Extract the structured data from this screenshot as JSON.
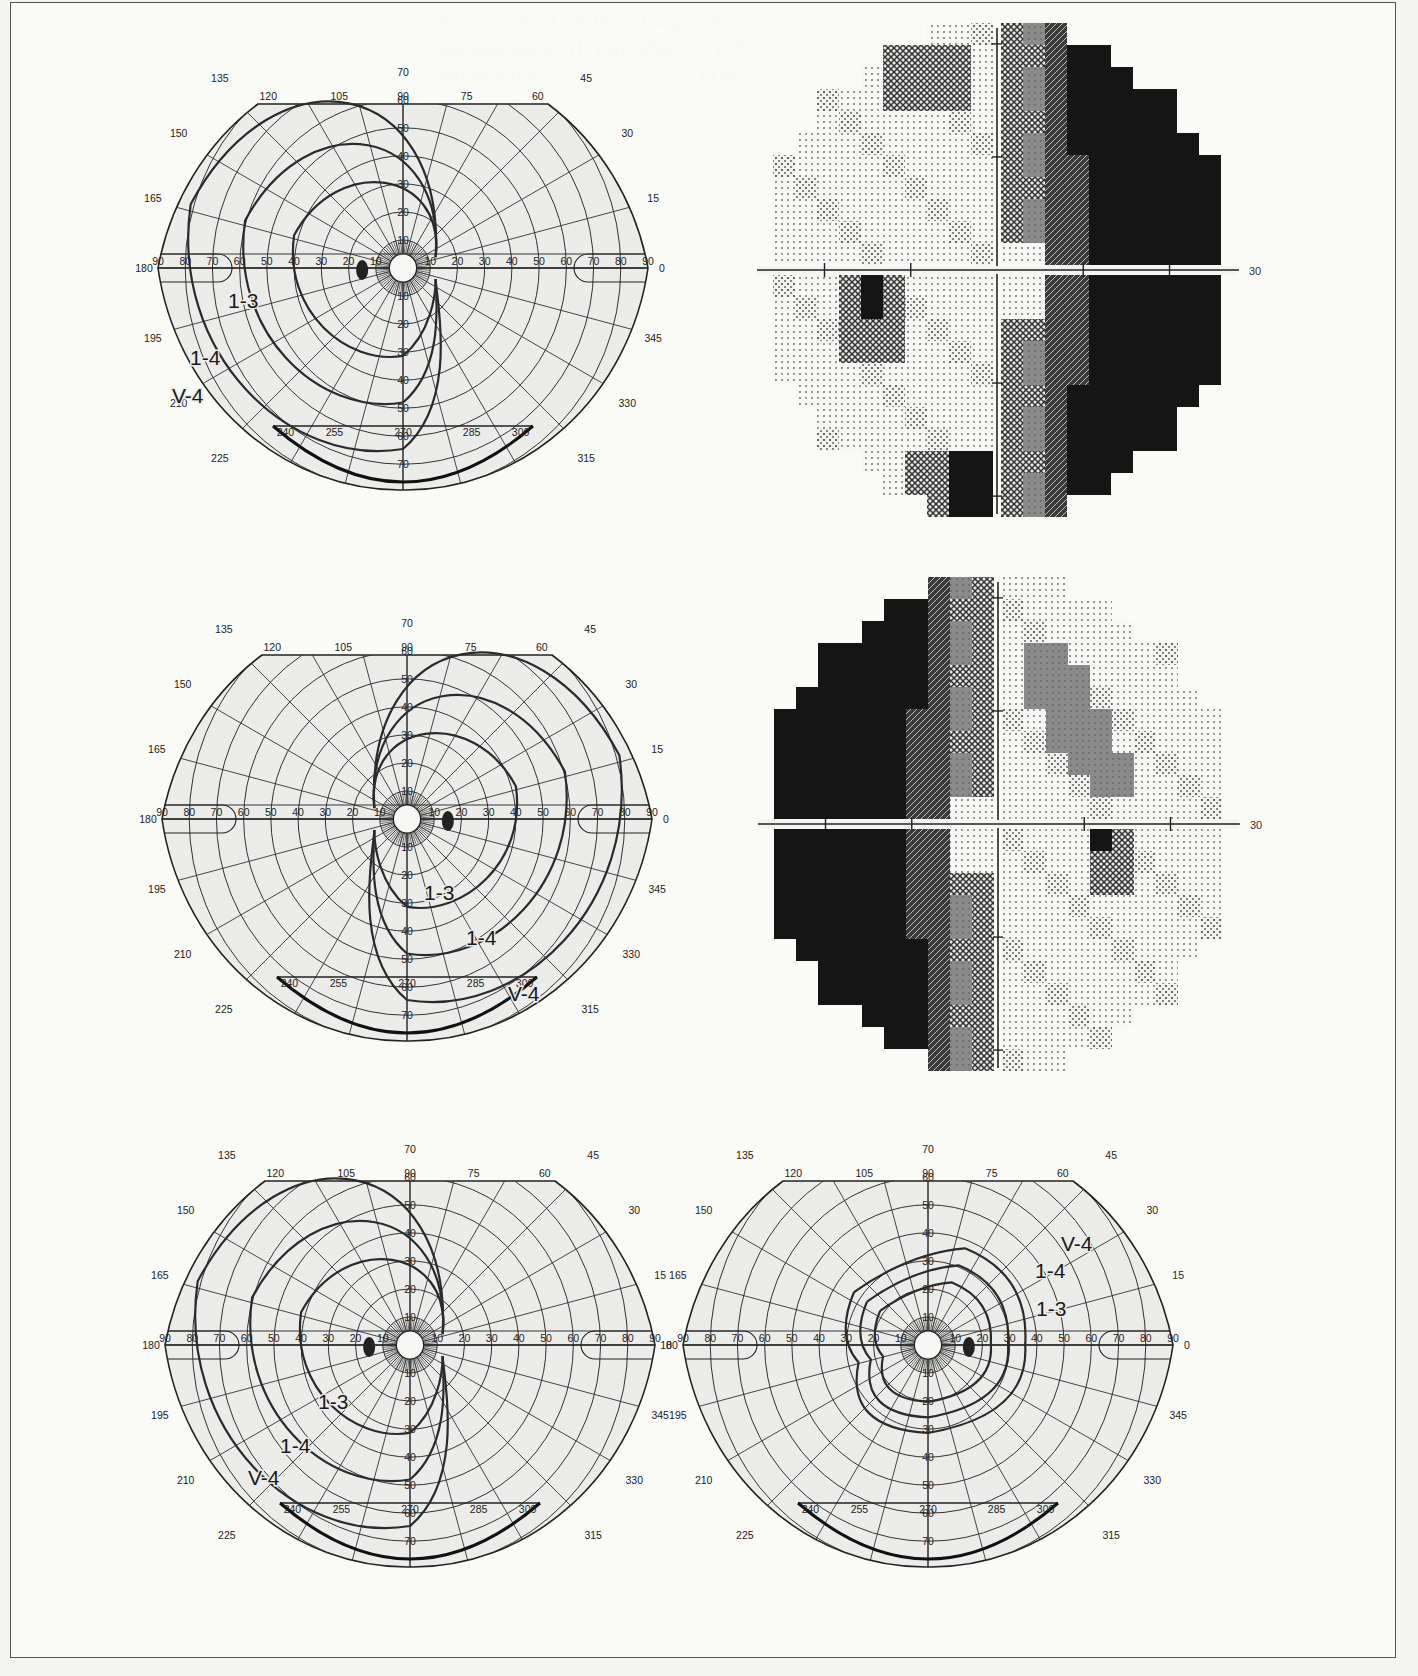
{
  "figure": {
    "kind": "Visual field examination figure",
    "border_color": "#555555",
    "background_color": "#f4f4f2",
    "chart_fill": "#ececeb"
  },
  "goldmann_grid": {
    "meridian_labels": [
      "0",
      "15",
      "30",
      "45",
      "60",
      "75",
      "90",
      "105",
      "120",
      "135",
      "150",
      "165",
      "180",
      "195",
      "210",
      "225",
      "240",
      "255",
      "270",
      "285",
      "300",
      "315",
      "330",
      "345"
    ],
    "horizontal_scale_labels": [
      "90",
      "80",
      "70",
      "60",
      "50",
      "40",
      "30",
      "20",
      "10",
      "10",
      "20",
      "30",
      "40",
      "50",
      "60",
      "70",
      "80",
      "90"
    ],
    "vertical_scale_labels_upper": [
      "10",
      "20",
      "30",
      "40",
      "50",
      "60",
      "70"
    ],
    "vertical_scale_labels_lower": [
      "10",
      "20",
      "30",
      "40",
      "50",
      "60",
      "70"
    ],
    "ring_degrees": [
      5,
      10,
      20,
      30,
      40,
      50,
      60,
      70,
      80,
      90
    ]
  },
  "panels": [
    {
      "id": "goldmann-1",
      "type": "goldmann",
      "position": "top-left",
      "eye_blind_spot_side": "left",
      "isopter_labels": [
        {
          "text": "1-3",
          "x": 228,
          "y": 308
        },
        {
          "text": "1-4",
          "x": 190,
          "y": 365
        },
        {
          "text": "V-4",
          "x": 172,
          "y": 403
        }
      ]
    },
    {
      "id": "greyscale-1",
      "type": "greyscale",
      "position": "top-right",
      "axis_label": "30",
      "dark_side": "right"
    },
    {
      "id": "goldmann-2",
      "type": "goldmann",
      "position": "middle-left",
      "eye_blind_spot_side": "right",
      "isopter_labels": [
        {
          "text": "1-3",
          "x": 424,
          "y": 900
        },
        {
          "text": "1-4",
          "x": 466,
          "y": 945
        },
        {
          "text": "V-4",
          "x": 508,
          "y": 1001
        }
      ]
    },
    {
      "id": "greyscale-2",
      "type": "greyscale",
      "position": "middle-right",
      "axis_label": "30",
      "dark_side": "left"
    },
    {
      "id": "goldmann-3",
      "type": "goldmann",
      "position": "bottom-left",
      "eye_blind_spot_side": "left",
      "isopter_labels": [
        {
          "text": "1-3",
          "x": 318,
          "y": 1409
        },
        {
          "text": "1-4",
          "x": 280,
          "y": 1453
        },
        {
          "text": "V-4",
          "x": 248,
          "y": 1485
        }
      ]
    },
    {
      "id": "goldmann-4",
      "type": "goldmann",
      "position": "bottom-right",
      "eye_blind_spot_side": "right",
      "isopter_labels": [
        {
          "text": "V-4",
          "x": 1061,
          "y": 1251
        },
        {
          "text": "1-4",
          "x": 1035,
          "y": 1278
        },
        {
          "text": "1-3",
          "x": 1036,
          "y": 1316
        }
      ]
    }
  ],
  "greyscale_legend_levels": [
    "normal-dots",
    "light-triangles",
    "crosshatch",
    "mid-grey",
    "dense-hatch",
    "black"
  ]
}
